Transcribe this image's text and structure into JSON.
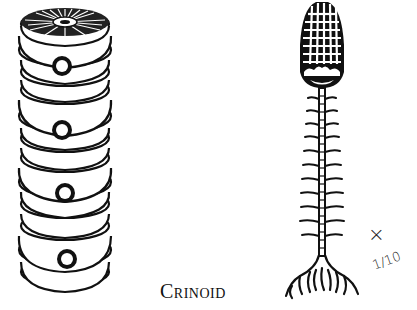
{
  "illustration": {
    "caption": "Crinoid",
    "scale_prefix": "×",
    "scale_fraction": "1/10",
    "figures": [
      {
        "name": "stem-column-segments",
        "description": "Stack of disc-shaped stem ossicles (columnals) with radial top face and star-shaped central canals",
        "segment_groups": 4
      },
      {
        "name": "whole-crinoid",
        "description": "Crinoid with latticed cup/crown, jointed stalk with paired cirri, and branching holdfast roots",
        "cirri_pairs": 11
      }
    ],
    "colors": {
      "ink": "#111111",
      "paper": "#ffffff"
    }
  }
}
